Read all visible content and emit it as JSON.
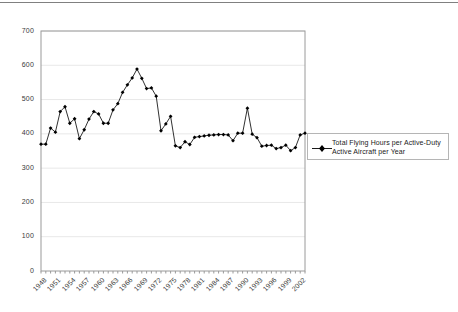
{
  "chart_data": {
    "type": "line",
    "title": "",
    "subtitle": "",
    "xlabel": "",
    "ylabel": "",
    "ylim": [
      0,
      700
    ],
    "xlim": [
      1948,
      2003
    ],
    "grid": "horizontal",
    "legend_position": "right",
    "marker": "filled-diamond",
    "line_color": "#1a1a1a",
    "marker_color": "#000000",
    "gridline_color": "#e8e8e8",
    "axis_color": "#9a9a9a",
    "ytick_labels": [
      "0",
      "100",
      "200",
      "300",
      "400",
      "500",
      "600",
      "700"
    ],
    "ytick_values": [
      0,
      100,
      200,
      300,
      400,
      500,
      600,
      700
    ],
    "xtick_labels": [
      "1948",
      "1951",
      "1954",
      "1957",
      "1960",
      "1963",
      "1966",
      "1969",
      "1972",
      "1975",
      "1978",
      "1981",
      "1984",
      "1987",
      "1990",
      "1993",
      "1996",
      "1999",
      "2002"
    ],
    "xtick_values": [
      1948,
      1951,
      1954,
      1957,
      1960,
      1963,
      1966,
      1969,
      1972,
      1975,
      1978,
      1981,
      1984,
      1987,
      1990,
      1993,
      1996,
      1999,
      2002
    ],
    "series": [
      {
        "name": "Total Flying Hours per Active-Duty Active Aircraft per Year",
        "x": [
          1948,
          1949,
          1950,
          1951,
          1952,
          1953,
          1954,
          1955,
          1956,
          1957,
          1958,
          1959,
          1960,
          1961,
          1962,
          1963,
          1964,
          1965,
          1966,
          1967,
          1968,
          1969,
          1970,
          1971,
          1972,
          1973,
          1974,
          1975,
          1976,
          1977,
          1978,
          1979,
          1980,
          1981,
          1982,
          1983,
          1984,
          1985,
          1986,
          1987,
          1988,
          1989,
          1990,
          1991,
          1992,
          1993,
          1994,
          1995,
          1996,
          1997,
          1998,
          1999,
          2000,
          2001,
          2002,
          2003
        ],
        "values": [
          370,
          370,
          417,
          405,
          465,
          479,
          431,
          444,
          386,
          412,
          443,
          465,
          458,
          431,
          431,
          470,
          488,
          521,
          543,
          563,
          589,
          562,
          532,
          534,
          510,
          409,
          429,
          451,
          365,
          360,
          377,
          369,
          390,
          392,
          394,
          396,
          397,
          398,
          398,
          397,
          380,
          402,
          402,
          475,
          399,
          389,
          364,
          366,
          367,
          357,
          360,
          367,
          351,
          360,
          397,
          402
        ]
      }
    ]
  },
  "legend": {
    "entries": [
      {
        "label_line1": "Total Flying Hours per Active-Duty",
        "label_line2": "Active Aircraft per Year",
        "marker": "filled-diamond-with-line",
        "color": "#000000"
      }
    ]
  }
}
